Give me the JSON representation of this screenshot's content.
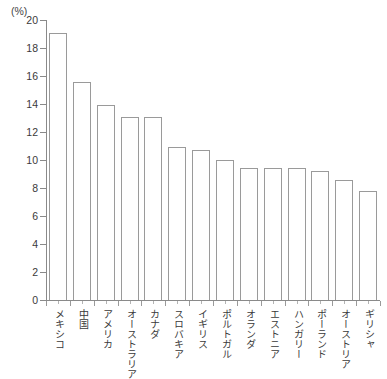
{
  "chart_data": {
    "type": "bar",
    "title": "",
    "subtitle": "",
    "xlabel": "",
    "ylabel": "",
    "unit_label": "(%)",
    "ylim": [
      0,
      20
    ],
    "ytick_step": 2,
    "yticks": [
      20,
      18,
      16,
      14,
      12,
      10,
      8,
      6,
      4,
      2,
      0
    ],
    "ytick_labels": [
      "20",
      "18",
      "16",
      "14",
      "12",
      "10",
      "8",
      "6",
      "4",
      "2",
      "0"
    ],
    "grid": false,
    "legend": false,
    "legend_position": "none",
    "bar_fill_color": "#ffffff",
    "bar_edge_color": "#9a9a9a",
    "axis_color": "#8a8a8a",
    "categories": [
      "メキシコ",
      "中国",
      "アメリカ",
      "オーストラリア",
      "カナダ",
      "スロバキア",
      "イギリス",
      "ポルトガル",
      "オランダ",
      "エストニア",
      "ハンガリー",
      "ポーランド",
      "オーストリア",
      "ギリシャ"
    ],
    "values": [
      19.1,
      15.6,
      13.9,
      13.1,
      13.1,
      10.9,
      10.7,
      10.0,
      9.4,
      9.4,
      9.4,
      9.2,
      8.6,
      7.8
    ]
  }
}
